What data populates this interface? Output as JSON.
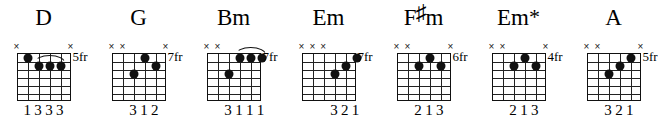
{
  "sheet": {
    "title": "Guitar chord diagrams",
    "strings": 6,
    "frets": 6
  },
  "chords": [
    {
      "name": "D",
      "name_parts": {
        "base": "D",
        "accidental": "",
        "suffix": ""
      },
      "fret_label": "5fr",
      "base_fret": 5,
      "muted_strings": [
        1,
        6
      ],
      "mute_marks": [
        "×",
        "×"
      ],
      "dots": [
        {
          "string": 2,
          "fret": 1
        },
        {
          "string": 3,
          "fret": 2
        },
        {
          "string": 4,
          "fret": 2
        },
        {
          "string": 5,
          "fret": 2
        }
      ],
      "barre": {
        "fret": 2,
        "from_string": 3,
        "to_string": 5
      },
      "fingering": "1333",
      "finger_numbers": [
        {
          "string": 2,
          "label": "1"
        },
        {
          "string": 3,
          "label": "3"
        },
        {
          "string": 4,
          "label": "3"
        },
        {
          "string": 5,
          "label": "3"
        }
      ]
    },
    {
      "name": "G",
      "name_parts": {
        "base": "G",
        "accidental": "",
        "suffix": ""
      },
      "fret_label": "7fr",
      "base_fret": 7,
      "muted_strings": [
        1,
        2,
        6
      ],
      "mute_marks": [
        "×",
        "×",
        "×"
      ],
      "dots": [
        {
          "string": 4,
          "fret": 1
        },
        {
          "string": 5,
          "fret": 2
        },
        {
          "string": 3,
          "fret": 3
        }
      ],
      "barre": null,
      "fingering": "312",
      "finger_numbers": [
        {
          "string": 3,
          "label": "3"
        },
        {
          "string": 4,
          "label": "1"
        },
        {
          "string": 5,
          "label": "2"
        }
      ]
    },
    {
      "name": "Bm",
      "name_parts": {
        "base": "Bm",
        "accidental": "",
        "suffix": ""
      },
      "fret_label": "7fr",
      "base_fret": 7,
      "muted_strings": [
        1,
        2
      ],
      "mute_marks": [
        "×",
        "×"
      ],
      "dots": [
        {
          "string": 4,
          "fret": 1
        },
        {
          "string": 5,
          "fret": 1
        },
        {
          "string": 6,
          "fret": 1
        },
        {
          "string": 3,
          "fret": 3
        }
      ],
      "barre": {
        "fret": 1,
        "from_string": 4,
        "to_string": 6
      },
      "fingering": "3111",
      "finger_numbers": [
        {
          "string": 3,
          "label": "3"
        },
        {
          "string": 4,
          "label": "1"
        },
        {
          "string": 5,
          "label": "1"
        },
        {
          "string": 6,
          "label": "1"
        }
      ]
    },
    {
      "name": "Em",
      "name_parts": {
        "base": "Em",
        "accidental": "",
        "suffix": ""
      },
      "fret_label": "7fr",
      "base_fret": 7,
      "muted_strings": [
        1,
        2,
        3
      ],
      "mute_marks": [
        "×",
        "×",
        "×"
      ],
      "dots": [
        {
          "string": 6,
          "fret": 1
        },
        {
          "string": 5,
          "fret": 2
        },
        {
          "string": 4,
          "fret": 3
        }
      ],
      "barre": null,
      "fingering": "321",
      "finger_numbers": [
        {
          "string": 4,
          "label": "3"
        },
        {
          "string": 5,
          "label": "2"
        },
        {
          "string": 6,
          "label": "1"
        }
      ]
    },
    {
      "name": "F#m",
      "name_parts": {
        "base": "F",
        "accidental": "♯",
        "suffix": "m"
      },
      "fret_label": "6fr",
      "base_fret": 6,
      "muted_strings": [
        1,
        2,
        6
      ],
      "mute_marks": [
        "×",
        "×",
        "×"
      ],
      "dots": [
        {
          "string": 4,
          "fret": 1
        },
        {
          "string": 3,
          "fret": 2
        },
        {
          "string": 5,
          "fret": 2
        }
      ],
      "barre": null,
      "fingering": "213",
      "finger_numbers": [
        {
          "string": 3,
          "label": "2"
        },
        {
          "string": 4,
          "label": "1"
        },
        {
          "string": 5,
          "label": "3"
        }
      ]
    },
    {
      "name": "Em*",
      "name_parts": {
        "base": "Em",
        "accidental": "",
        "suffix": "*"
      },
      "fret_label": "4fr",
      "base_fret": 4,
      "muted_strings": [
        1,
        2,
        6
      ],
      "mute_marks": [
        "×",
        "×",
        "×"
      ],
      "dots": [
        {
          "string": 4,
          "fret": 1
        },
        {
          "string": 3,
          "fret": 2
        },
        {
          "string": 5,
          "fret": 2
        }
      ],
      "barre": null,
      "fingering": "213",
      "finger_numbers": [
        {
          "string": 3,
          "label": "2"
        },
        {
          "string": 4,
          "label": "1"
        },
        {
          "string": 5,
          "label": "3"
        }
      ]
    },
    {
      "name": "A",
      "name_parts": {
        "base": "A",
        "accidental": "",
        "suffix": ""
      },
      "fret_label": "5fr",
      "base_fret": 5,
      "muted_strings": [
        1,
        2,
        6
      ],
      "mute_marks": [
        "×",
        "×",
        "×"
      ],
      "dots": [
        {
          "string": 5,
          "fret": 1
        },
        {
          "string": 4,
          "fret": 2
        },
        {
          "string": 3,
          "fret": 3
        }
      ],
      "barre": null,
      "fingering": "321",
      "finger_numbers": [
        {
          "string": 3,
          "label": "3"
        },
        {
          "string": 4,
          "label": "2"
        },
        {
          "string": 5,
          "label": "1"
        }
      ]
    }
  ]
}
